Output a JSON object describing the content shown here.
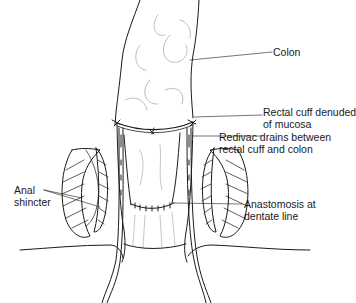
{
  "figure": {
    "labels": {
      "colon": "Colon",
      "rectal_cuff_line1": "Rectal cuff denuded",
      "rectal_cuff_line2": "of mucosa",
      "redivac_line1": "Redivac drains between",
      "redivac_line2": "rectal cuff and colon",
      "anal_line1": "Anal",
      "anal_line2": "shincter",
      "anastomosis_line1": "Anastomosis at",
      "anastomosis_line2": "dentate line"
    },
    "colors": {
      "line": "#1a1a1a",
      "faint": "#9a9a9a",
      "background": "#ffffff"
    }
  }
}
